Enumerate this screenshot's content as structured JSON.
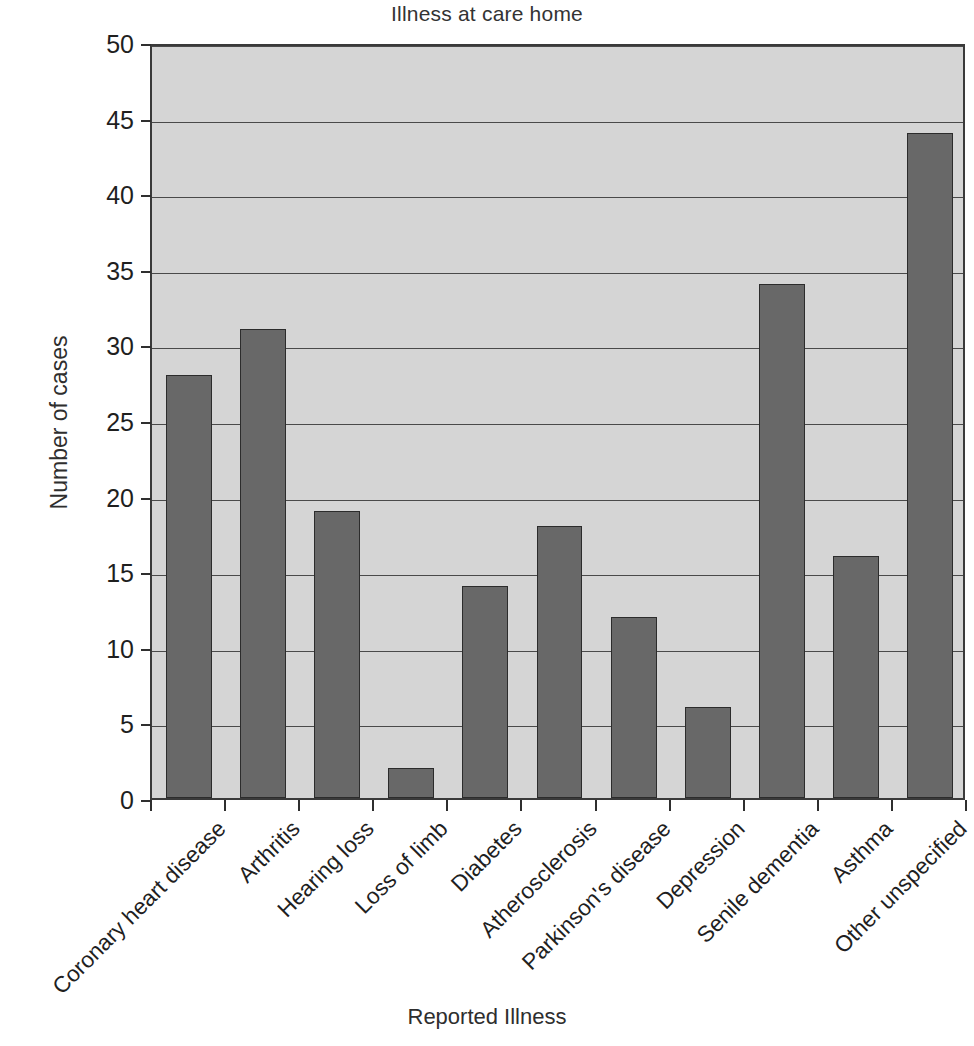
{
  "chart_data": {
    "type": "bar",
    "title": "Illness at care home",
    "xlabel": "Reported Illness",
    "ylabel": "Number of cases",
    "categories": [
      "Coronary heart disease",
      "Arthritis",
      "Hearing loss",
      "Loss of limb",
      "Diabetes",
      "Atherosclerosis",
      "Parkinson's disease",
      "Depression",
      "Senile dementia",
      "Asthma",
      "Other unspecified"
    ],
    "values": [
      28,
      31,
      19,
      2,
      14,
      18,
      12,
      6,
      34,
      16,
      44
    ],
    "ylim": [
      0,
      50
    ],
    "ytick_labels": [
      "0",
      "5",
      "10",
      "15",
      "20",
      "25",
      "30",
      "35",
      "40",
      "45",
      "50"
    ],
    "ytick_values": [
      0,
      5,
      10,
      15,
      20,
      25,
      30,
      35,
      40,
      45,
      50
    ],
    "grid": true,
    "legend": "none",
    "bar_color": "#686868",
    "bar_edge_color": "#2c2c2c",
    "plot_background_color": "#d5d5d5",
    "axis_color": "#3a3a3a",
    "gridline_color": "#4a4a4a",
    "text_color": "#1f1f1f",
    "xtick_label_rotation_degrees": -45
  }
}
